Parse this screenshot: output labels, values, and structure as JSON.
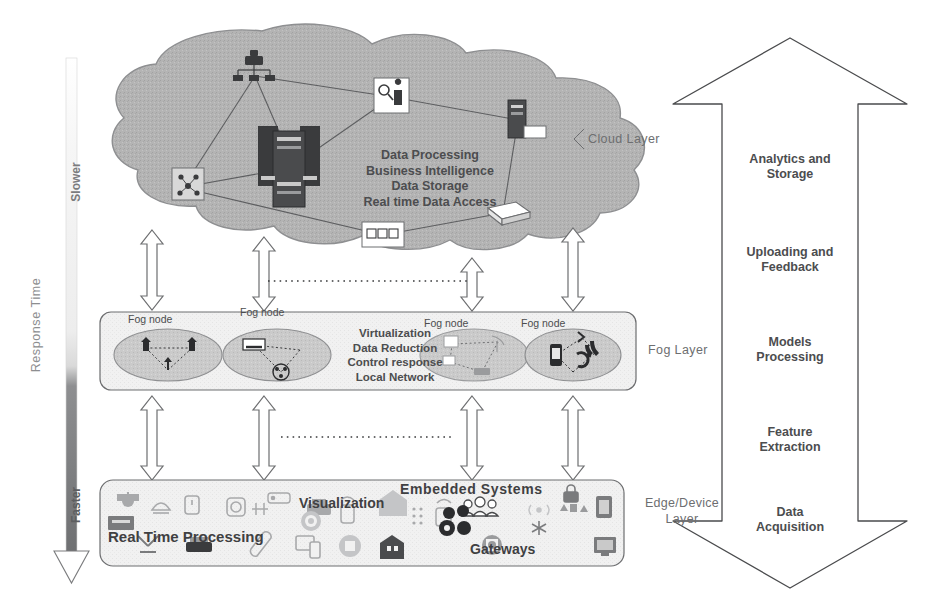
{
  "response_axis": {
    "title": "Response Time",
    "top_label": "Slower",
    "bottom_label": "Faster",
    "gradient_top_color": "#ffffff",
    "gradient_bottom_color": "#6e6f71"
  },
  "cloud_layer": {
    "label": "Cloud Layer",
    "capabilities": [
      "Data Processing",
      "Business Intelligence",
      "Data Storage",
      "Real time Data Access"
    ],
    "fill_color": "#b3b3b3",
    "nodes": [
      {
        "name": "network-switch-icon"
      },
      {
        "name": "monitoring-screen-icon"
      },
      {
        "name": "server-rack-icon"
      },
      {
        "name": "database-server-icon"
      },
      {
        "name": "network-chip-icon"
      },
      {
        "name": "storage-array-icon"
      },
      {
        "name": "blade-server-icon"
      }
    ]
  },
  "fog_layer": {
    "label": "Fog Layer",
    "capabilities": [
      "Virtualization",
      "Data Reduction",
      "Control response",
      "Local Network"
    ],
    "fill_color": "#f2f2f2",
    "node_fill_color": "#c9c9c9",
    "nodes": [
      {
        "caption": "Fog node",
        "icons": [
          "cell-tower-icon",
          "cell-tower-icon",
          "antenna-icon"
        ]
      },
      {
        "caption": "Fog node",
        "icons": [
          "gateway-icon",
          "network-hub-icon"
        ]
      },
      {
        "caption": "Fog node",
        "icons": [
          "sensor-icon",
          "sensor-icon",
          "satellite-dish-icon",
          "router-icon"
        ]
      },
      {
        "caption": "Fog node",
        "icons": [
          "mobile-phone-icon",
          "wifi-signal-icon",
          "bluetooth-icon",
          "handset-icon"
        ]
      }
    ]
  },
  "edge_layer": {
    "label_line1": "Edge/Device",
    "label_line2": "Layer",
    "fill_color": "#f2f2f2",
    "captions": [
      "Real Time Processing",
      "Visualization",
      "Embedded Systems",
      "Gateways"
    ],
    "device_icons": [
      "security-camera-icon",
      "smart-lamp-icon",
      "smart-watch-icon",
      "thermostat-icon",
      "remote-control-icon",
      "printer-icon",
      "smart-home-icon",
      "cloud-upload-icon",
      "fingerprint-icon",
      "dots-matrix-icon",
      "wifi-router-icon",
      "people-group-icon",
      "rfid-signal-icon",
      "lock-icon",
      "industry-icon",
      "tablet-icon",
      "x-ray-icon",
      "vehicle-icon",
      "usb-icon",
      "devices-sync-icon",
      "chip-icon",
      "building-icon",
      "settings-gear-icon",
      "cloud-network-icon",
      "star-node-icon",
      "monitor-icon"
    ]
  },
  "process_arrow": {
    "direction": "bidirectional-vertical",
    "stages": [
      {
        "line1": "Analytics and",
        "line2": "Storage"
      },
      {
        "line1": "Uploading and",
        "line2": "Feedback"
      },
      {
        "line1": "Models",
        "line2": "Processing"
      },
      {
        "line1": "Feature",
        "line2": "Extraction"
      },
      {
        "line1": "Data",
        "line2": "Acquisition"
      }
    ]
  },
  "connectors": {
    "cloud_to_fog": 4,
    "fog_to_edge": 4,
    "style": "double-headed-outline-arrow"
  }
}
